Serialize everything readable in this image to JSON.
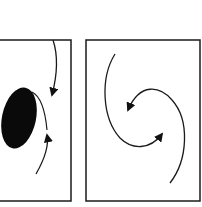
{
  "figure": {
    "panels": [
      {
        "id": "left",
        "frame": {
          "x": 0,
          "y": 40,
          "w": 71,
          "h": 160
        },
        "elements": [
          "filled-ellipse",
          "arrow-down-curved",
          "arrow-up-curved"
        ]
      },
      {
        "id": "right",
        "frame": {
          "x": 86,
          "y": 40,
          "w": 114,
          "h": 160
        },
        "elements": [
          "spiral-arm-outer-left",
          "spiral-arm-outer-right",
          "inner-arrow-left",
          "inner-arrow-right"
        ]
      }
    ],
    "colors": {
      "stroke": "#1a1a1a",
      "fill": "#0a0a0a",
      "background": "#ffffff"
    }
  }
}
